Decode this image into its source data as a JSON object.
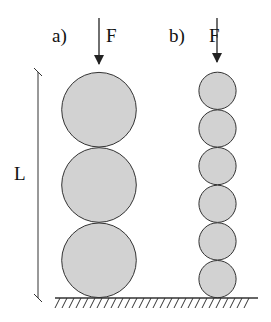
{
  "labels": {
    "a": "a)",
    "b": "b)",
    "force_a": "F",
    "force_b": "F",
    "length": "L"
  },
  "colors": {
    "circle_fill": "#d2d2d2",
    "stroke": "#333333",
    "background": "#ffffff"
  },
  "columns": [
    {
      "id": "a",
      "spheres": 3
    },
    {
      "id": "b",
      "spheres": 6
    }
  ]
}
